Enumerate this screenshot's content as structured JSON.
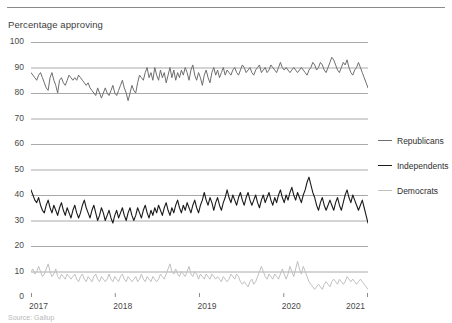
{
  "figure": {
    "axis_title": "Percentage approving",
    "source_note": "Source: Gallup"
  },
  "legend": {
    "position": "right",
    "items": [
      {
        "label": "Republicans",
        "color": "#6e6e6e"
      },
      {
        "label": "Independents",
        "color": "#1b1b1b"
      },
      {
        "label": "Democrats",
        "color": "#c0c0c0"
      }
    ]
  },
  "chart_data": {
    "type": "line",
    "title": "",
    "subtitle": "",
    "xlabel": "",
    "ylabel": "Percentage approving",
    "xlim": [
      2017.0,
      2021.0
    ],
    "ylim": [
      0,
      100
    ],
    "grid": true,
    "yticks": [
      0,
      10,
      20,
      30,
      40,
      50,
      60,
      70,
      80,
      90,
      100
    ],
    "xticks": [
      2017,
      2018,
      2019,
      2020,
      2021
    ],
    "xtick_labels": [
      "2017",
      "2018",
      "2019",
      "2020",
      "2021"
    ],
    "legend_position": "right",
    "series": [
      {
        "name": "Republicans",
        "color": "#6e6e6e",
        "values": [
          88,
          87,
          86,
          85,
          87,
          88,
          86,
          84,
          82,
          81,
          86,
          88,
          85,
          83,
          80,
          85,
          86,
          84,
          83,
          85,
          87,
          86,
          85,
          86,
          85,
          87,
          86,
          85,
          84,
          83,
          84,
          82,
          81,
          80,
          79,
          82,
          80,
          78,
          80,
          82,
          80,
          79,
          81,
          83,
          80,
          79,
          81,
          83,
          85,
          82,
          80,
          77,
          80,
          83,
          81,
          80,
          84,
          87,
          86,
          85,
          88,
          90,
          86,
          88,
          85,
          90,
          87,
          85,
          89,
          86,
          88,
          84,
          87,
          90,
          86,
          89,
          85,
          88,
          86,
          89,
          87,
          90,
          88,
          85,
          89,
          91,
          87,
          85,
          88,
          86,
          83,
          87,
          89,
          86,
          84,
          88,
          90,
          87,
          89,
          86,
          88,
          90,
          87,
          89,
          88,
          87,
          89,
          90,
          88,
          87,
          89,
          91,
          90,
          88,
          89,
          90,
          88,
          87,
          89,
          90,
          91,
          88,
          89,
          90,
          88,
          89,
          91,
          90,
          89,
          88,
          90,
          92,
          90,
          89,
          90,
          89,
          88,
          89,
          90,
          89,
          88,
          89,
          90,
          89,
          88,
          87,
          89,
          90,
          92,
          91,
          89,
          90,
          92,
          91,
          89,
          88,
          90,
          92,
          94,
          93,
          91,
          89,
          88,
          90,
          92,
          91,
          93,
          90,
          88,
          87,
          89,
          90,
          92,
          90,
          88,
          86,
          84,
          82
        ]
      },
      {
        "name": "Independents",
        "color": "#1b1b1b",
        "values": [
          42,
          40,
          38,
          37,
          39,
          36,
          34,
          33,
          36,
          38,
          35,
          33,
          36,
          34,
          32,
          35,
          37,
          34,
          32,
          35,
          33,
          31,
          34,
          36,
          33,
          31,
          33,
          36,
          38,
          35,
          33,
          31,
          34,
          36,
          33,
          30,
          32,
          35,
          33,
          30,
          32,
          34,
          31,
          29,
          32,
          34,
          31,
          33,
          35,
          32,
          30,
          33,
          35,
          32,
          30,
          32,
          35,
          33,
          31,
          34,
          36,
          33,
          31,
          34,
          32,
          35,
          33,
          36,
          34,
          32,
          35,
          37,
          34,
          32,
          35,
          33,
          36,
          38,
          35,
          33,
          36,
          34,
          37,
          35,
          33,
          36,
          38,
          35,
          33,
          36,
          38,
          41,
          38,
          36,
          39,
          37,
          34,
          37,
          39,
          36,
          34,
          37,
          39,
          42,
          39,
          37,
          40,
          38,
          36,
          39,
          41,
          38,
          36,
          39,
          41,
          38,
          36,
          38,
          40,
          37,
          35,
          38,
          40,
          37,
          39,
          41,
          38,
          36,
          39,
          37,
          40,
          42,
          39,
          37,
          40,
          38,
          41,
          43,
          40,
          38,
          41,
          39,
          37,
          40,
          42,
          45,
          47,
          44,
          41,
          39,
          36,
          34,
          37,
          39,
          36,
          34,
          36,
          38,
          36,
          34,
          37,
          39,
          36,
          34,
          37,
          40,
          42,
          39,
          37,
          40,
          38,
          36,
          34,
          36,
          38,
          35,
          32,
          29
        ]
      },
      {
        "name": "Democrats",
        "color": "#c0c0c0",
        "values": [
          10,
          11,
          9,
          10,
          12,
          10,
          8,
          9,
          11,
          13,
          10,
          8,
          9,
          11,
          8,
          7,
          9,
          8,
          7,
          9,
          8,
          7,
          8,
          9,
          7,
          6,
          8,
          9,
          7,
          6,
          8,
          7,
          6,
          8,
          9,
          7,
          6,
          8,
          7,
          6,
          7,
          9,
          7,
          6,
          8,
          7,
          6,
          8,
          9,
          7,
          6,
          8,
          7,
          6,
          7,
          8,
          6,
          7,
          9,
          7,
          6,
          8,
          7,
          6,
          8,
          7,
          6,
          7,
          9,
          8,
          7,
          9,
          11,
          13,
          10,
          9,
          11,
          9,
          8,
          10,
          9,
          8,
          10,
          12,
          9,
          8,
          10,
          9,
          7,
          9,
          8,
          7,
          9,
          8,
          7,
          9,
          8,
          7,
          8,
          7,
          6,
          8,
          7,
          6,
          7,
          9,
          8,
          7,
          9,
          8,
          6,
          5,
          6,
          5,
          4,
          6,
          7,
          5,
          6,
          8,
          10,
          12,
          10,
          8,
          7,
          9,
          8,
          7,
          9,
          8,
          7,
          9,
          11,
          9,
          7,
          9,
          12,
          10,
          8,
          11,
          14,
          11,
          9,
          12,
          10,
          8,
          6,
          5,
          4,
          3,
          4,
          5,
          4,
          3,
          5,
          6,
          5,
          4,
          6,
          7,
          6,
          5,
          7,
          6,
          5,
          6,
          8,
          7,
          6,
          7,
          6,
          5,
          6,
          7,
          6,
          5,
          4,
          3
        ]
      }
    ]
  }
}
